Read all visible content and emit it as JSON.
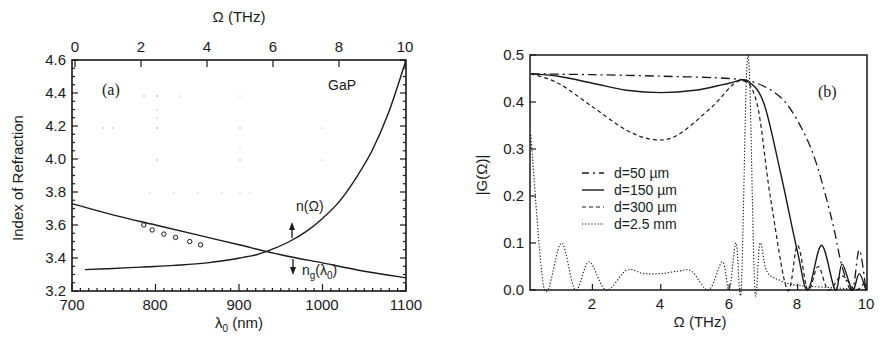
{
  "chart_data": [
    {
      "panel": "(a)",
      "type": "line",
      "title": "GaP",
      "xlabel": "λ0 (nm)",
      "ylabel": "Index of Refraction",
      "top_xlabel": "Ω (THz)",
      "xlim": [
        700,
        1100
      ],
      "ylim": [
        3.2,
        4.6
      ],
      "top_xlim": [
        0,
        10
      ],
      "xticks": [
        "700",
        "800",
        "900",
        "1000",
        "1100"
      ],
      "yticks": [
        "3.2",
        "3.4",
        "3.6",
        "3.8",
        "4.0",
        "4.2",
        "4.4",
        "4.6"
      ],
      "top_xticks": [
        "0",
        "2",
        "4",
        "6",
        "8",
        "10"
      ],
      "grid": false,
      "series": [
        {
          "name": "n(Ω)",
          "axis": "top",
          "x_top": [
            0.3,
            1,
            2,
            3,
            4,
            5,
            5.5,
            6,
            6.5,
            7,
            7.5,
            8,
            8.5,
            9,
            9.5,
            10
          ],
          "values": [
            3.33,
            3.335,
            3.345,
            3.355,
            3.37,
            3.4,
            3.42,
            3.455,
            3.5,
            3.56,
            3.64,
            3.74,
            3.88,
            4.05,
            4.28,
            4.58
          ]
        },
        {
          "name": "ng(λ0)",
          "axis": "bottom",
          "x": [
            700,
            750,
            800,
            850,
            900,
            950,
            1000,
            1050,
            1100
          ],
          "values": [
            3.73,
            3.66,
            3.6,
            3.54,
            3.48,
            3.42,
            3.37,
            3.32,
            3.28
          ]
        },
        {
          "name": "measured points",
          "style": "markers",
          "x": [
            786,
            796,
            810,
            824,
            841,
            854
          ],
          "values": [
            3.6,
            3.57,
            3.545,
            3.525,
            3.5,
            3.48
          ]
        }
      ],
      "annotations": [
        "(a)",
        "GaP",
        "n(Ω)",
        "ng(λ0)"
      ]
    },
    {
      "panel": "(b)",
      "type": "line",
      "xlabel": "Ω (THz)",
      "ylabel": "|G(Ω)|",
      "xlim": [
        0.2,
        10
      ],
      "ylim": [
        0.0,
        0.5
      ],
      "xticks": [
        "2",
        "4",
        "6",
        "8",
        "10"
      ],
      "yticks": [
        "0.0",
        "0.1",
        "0.2",
        "0.3",
        "0.4",
        "0.5"
      ],
      "grid": false,
      "legend_position": "center-left",
      "series": [
        {
          "name": "d=50 µm",
          "style": "dash-dot",
          "x": [
            0.2,
            2,
            4,
            6,
            6.8,
            7.5,
            8,
            8.5,
            9,
            9.3,
            9.6,
            9.8,
            10
          ],
          "values": [
            0.46,
            0.458,
            0.455,
            0.45,
            0.44,
            0.41,
            0.36,
            0.28,
            0.15,
            0.05,
            0.0,
            0.085,
            0.0
          ]
        },
        {
          "name": "d=150 µm",
          "style": "solid",
          "x": [
            0.2,
            1,
            2,
            3,
            4,
            5,
            6,
            6.5,
            7,
            7.5,
            8,
            8.3,
            8.7,
            9.1,
            9.3,
            9.6,
            9.8,
            10
          ],
          "values": [
            0.46,
            0.455,
            0.44,
            0.425,
            0.42,
            0.425,
            0.44,
            0.445,
            0.4,
            0.25,
            0.08,
            0.0,
            0.095,
            0.0,
            0.055,
            0.0,
            0.035,
            0.0
          ]
        },
        {
          "name": "d=300 µm",
          "style": "dashed",
          "x": [
            0.2,
            1,
            2,
            3,
            3.8,
            4.5,
            5.5,
            6.3,
            6.8,
            7.2,
            7.7,
            8,
            8.3,
            8.6,
            8.9,
            9.3,
            9.7,
            10
          ],
          "values": [
            0.46,
            0.44,
            0.39,
            0.34,
            0.32,
            0.33,
            0.39,
            0.445,
            0.4,
            0.2,
            0.0,
            0.095,
            0.0,
            0.05,
            0.0,
            0.03,
            0.0,
            0.02
          ]
        },
        {
          "name": "d=2.5 mm",
          "style": "dotted",
          "x": [
            0.2,
            0.5,
            0.7,
            1.1,
            1.5,
            1.9,
            2.4,
            3.0,
            3.5,
            4.0,
            4.5,
            4.9,
            5.4,
            5.8,
            6.0,
            6.2,
            6.35,
            6.5,
            6.6,
            6.75,
            6.9,
            7.1,
            7.5,
            8,
            9,
            10
          ],
          "values": [
            0.33,
            0.05,
            0.0,
            0.1,
            0.0,
            0.06,
            0.0,
            0.042,
            0.035,
            0.035,
            0.04,
            0.04,
            0.0,
            0.06,
            0.0,
            0.1,
            0.0,
            0.445,
            0.445,
            0.0,
            0.1,
            0.04,
            0.02,
            0.01,
            0.005,
            0.0
          ]
        }
      ],
      "annotations": [
        "(b)"
      ]
    }
  ],
  "panel_a": {
    "label": "(a)",
    "material": "GaP",
    "xlabel": "λ",
    "xlabel_sub": "0",
    "xlabel_unit": " (nm)",
    "ylabel": "Index of Refraction",
    "top_xlabel": "Ω (THz)",
    "n_label": "n(Ω)",
    "ng_label_main": "n",
    "ng_label_sub": "g",
    "ng_label_arg": "(λ",
    "ng_label_arg_sub": "0",
    "ng_label_close": ")",
    "xticks": [
      "700",
      "800",
      "900",
      "1000",
      "1100"
    ],
    "yticks": [
      "3.2",
      "3.4",
      "3.6",
      "3.8",
      "4.0",
      "4.2",
      "4.4",
      "4.6"
    ],
    "top_xticks": [
      "0",
      "2",
      "4",
      "6",
      "8",
      "10"
    ]
  },
  "panel_b": {
    "label": "(b)",
    "xlabel": "Ω (THz)",
    "ylabel": "|G(Ω)|",
    "xticks": [
      "2",
      "4",
      "6",
      "8",
      "10"
    ],
    "yticks": [
      "0.0",
      "0.1",
      "0.2",
      "0.3",
      "0.4",
      "0.5"
    ],
    "legend": [
      {
        "label": "d=50 µm",
        "style": "dash-dot"
      },
      {
        "label": "d=150 µm",
        "style": "solid"
      },
      {
        "label": "d=300 µm",
        "style": "dashed"
      },
      {
        "label": "d=2.5 mm",
        "style": "dotted"
      }
    ]
  }
}
